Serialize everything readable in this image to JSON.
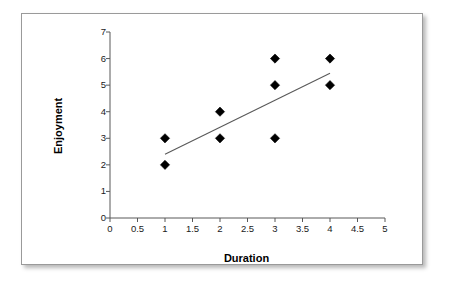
{
  "figure": {
    "background_color": "#ffffff",
    "frame_color": "#9a9a9a",
    "axis_color": "#595959",
    "marker_color": "#000000",
    "trendline_color": "#595959"
  },
  "chart_data": {
    "type": "scatter",
    "title": "",
    "xlabel": "Duration",
    "ylabel": "Enjoyment",
    "xlim": [
      0,
      5
    ],
    "ylim": [
      0,
      7
    ],
    "grid": false,
    "legend": false,
    "x_ticks": [
      0,
      0.5,
      1,
      1.5,
      2,
      2.5,
      3,
      3.5,
      4,
      4.5,
      5
    ],
    "x_tick_labels": [
      "0",
      "0.5",
      "1",
      "1.5",
      "2",
      "2.5",
      "3",
      "3.5",
      "4",
      "4.5",
      "5"
    ],
    "y_ticks": [
      0,
      1,
      2,
      3,
      4,
      5,
      6,
      7
    ],
    "y_tick_labels": [
      "0",
      "1",
      "2",
      "3",
      "4",
      "5",
      "6",
      "7"
    ],
    "marker": "diamond",
    "points": [
      {
        "x": 1,
        "y": 3
      },
      {
        "x": 1,
        "y": 2
      },
      {
        "x": 2,
        "y": 4
      },
      {
        "x": 2,
        "y": 3
      },
      {
        "x": 3,
        "y": 6
      },
      {
        "x": 3,
        "y": 5
      },
      {
        "x": 3,
        "y": 3
      },
      {
        "x": 4,
        "y": 6
      },
      {
        "x": 4,
        "y": 5
      }
    ],
    "trendline": {
      "type": "linear",
      "x_start": 1.0,
      "y_start": 2.4,
      "x_end": 4.0,
      "y_end": 5.45
    }
  }
}
